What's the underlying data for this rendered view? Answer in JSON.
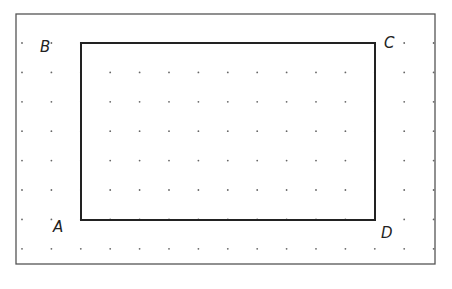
{
  "diagram": {
    "type": "dot-grid-rectangle",
    "frame": {
      "x": 16,
      "y": 14,
      "w": 419,
      "h": 250,
      "stroke": "#555555"
    },
    "grid": {
      "x_start": 22,
      "y_start": 43,
      "spacing": 29.4,
      "cols": 15,
      "rows": 8,
      "dot_color": "#666666"
    },
    "rectangle": {
      "x1": 81,
      "y1": 43,
      "x2": 375,
      "y2": 220,
      "stroke": "#222222"
    },
    "vertices": [
      {
        "label": "A",
        "x": 53,
        "y": 232
      },
      {
        "label": "B",
        "x": 40,
        "y": 52
      },
      {
        "label": "C",
        "x": 384,
        "y": 48
      },
      {
        "label": "D",
        "x": 381,
        "y": 238
      }
    ]
  }
}
